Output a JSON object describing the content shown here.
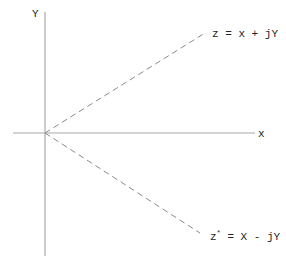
{
  "diagram": {
    "type": "complex-plane",
    "axes": {
      "x_label": "x",
      "y_label": "Y",
      "color": "#a8a8a8"
    },
    "vectors": [
      {
        "label": "z = x + jY",
        "style": "dashed",
        "direction": "upper-right"
      },
      {
        "label": "z* = X - jY",
        "label_main": "z",
        "label_sup": "*",
        "label_rest": " = X - jY",
        "style": "dashed",
        "direction": "lower-right"
      }
    ],
    "line_color": "#8a8a8a",
    "text_color": "#222222"
  }
}
